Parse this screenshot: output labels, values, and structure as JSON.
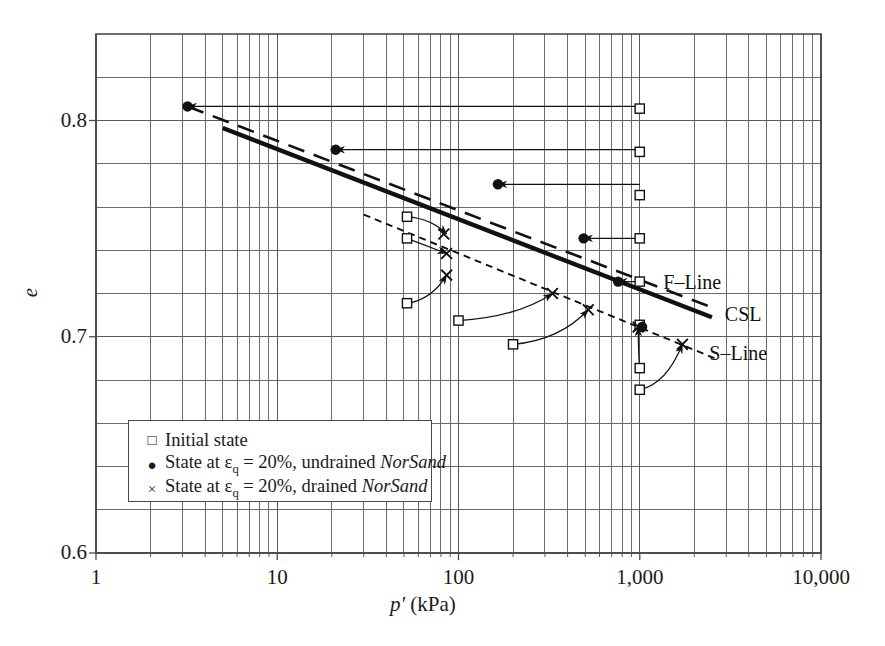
{
  "chart_data": {
    "type": "scatter",
    "title": "",
    "xlabel": "p' (kPa)",
    "ylabel": "e",
    "xscale": "log",
    "xlim": [
      1,
      10000
    ],
    "ylim": [
      0.6,
      0.84
    ],
    "xticks": [
      "1",
      "10",
      "100",
      "1,000",
      "10,000"
    ],
    "xtick_values": [
      1,
      10,
      100,
      1000,
      10000
    ],
    "yticks": [
      "0.6",
      "0.7",
      "0.8"
    ],
    "ytick_values": [
      0.6,
      0.7,
      0.8
    ],
    "grid": "log-minor-vertical, 0.02-minor-horizontal",
    "legend_position": "lower-left-inside",
    "series": [
      {
        "name": "Initial state",
        "marker": "open-square",
        "points": [
          {
            "p": 1000,
            "e": 0.8055
          },
          {
            "p": 1000,
            "e": 0.7855
          },
          {
            "p": 1000,
            "e": 0.7655
          },
          {
            "p": 1000,
            "e": 0.7455
          },
          {
            "p": 1000,
            "e": 0.7255
          },
          {
            "p": 1000,
            "e": 0.7055
          },
          {
            "p": 1000,
            "e": 0.6855
          },
          {
            "p": 1000,
            "e": 0.6755
          },
          {
            "p": 52,
            "e": 0.7555
          },
          {
            "p": 52,
            "e": 0.7455
          },
          {
            "p": 52,
            "e": 0.7155
          },
          {
            "p": 100,
            "e": 0.7075
          },
          {
            "p": 200,
            "e": 0.6965
          }
        ]
      },
      {
        "name": "State at eq = 20%, undrained NorSand",
        "marker": "filled-circle",
        "points": [
          {
            "p": 3.2,
            "e": 0.8065
          },
          {
            "p": 21,
            "e": 0.7865
          },
          {
            "p": 165,
            "e": 0.7705
          },
          {
            "p": 490,
            "e": 0.7455
          },
          {
            "p": 760,
            "e": 0.7255
          },
          {
            "p": 1030,
            "e": 0.7045
          }
        ]
      },
      {
        "name": "State at eq = 20%, drained NorSand",
        "marker": "cross",
        "points": [
          {
            "p": 83,
            "e": 0.7475
          },
          {
            "p": 86,
            "e": 0.7385
          },
          {
            "p": 86,
            "e": 0.7285
          },
          {
            "p": 330,
            "e": 0.72
          },
          {
            "p": 520,
            "e": 0.7125
          },
          {
            "p": 980,
            "e": 0.7045
          },
          {
            "p": 1720,
            "e": 0.6965
          }
        ]
      }
    ],
    "lines": [
      {
        "name": "F-Line",
        "style": "dashed",
        "label": "F–Line",
        "p1": 3.2,
        "e1": 0.8065,
        "p2": 2600,
        "e2": 0.713
      },
      {
        "name": "CSL",
        "style": "solid-thick",
        "label": "CSL",
        "p1": 5.0,
        "e1": 0.7965,
        "p2": 2500,
        "e2": 0.709
      },
      {
        "name": "S-Line",
        "style": "dotted",
        "label": "S–Line",
        "p1": 30,
        "e1": 0.7565,
        "p2": 2600,
        "e2": 0.69
      }
    ],
    "annotations": [
      {
        "type": "arrow",
        "style": "straight-horizontal",
        "from_p": 1000,
        "to_p": 3.2,
        "e": 0.8065
      },
      {
        "type": "arrow",
        "style": "straight-horizontal",
        "from_p": 1000,
        "to_p": 21,
        "e": 0.7865
      },
      {
        "type": "arrow",
        "style": "straight-horizontal",
        "from_p": 1000,
        "to_p": 165,
        "e": 0.7705
      },
      {
        "type": "arrow",
        "style": "straight-horizontal",
        "from_p": 1000,
        "to_p": 490,
        "e": 0.7455
      },
      {
        "type": "arrow",
        "style": "straight-horizontal",
        "from_p": 1000,
        "to_p": 760,
        "e": 0.7255
      },
      {
        "type": "arrow",
        "style": "straight-horizontal",
        "from_p": 1000,
        "to_p": 1030,
        "e": 0.7045
      },
      {
        "type": "arrow",
        "style": "curved",
        "from_p": 52,
        "from_e": 0.7555,
        "to_p": 86,
        "to_e": 0.7475
      },
      {
        "type": "arrow",
        "style": "straight-horizontal",
        "from_p": 52,
        "from_e": 0.7455,
        "to_p": 86,
        "to_e": 0.7385
      },
      {
        "type": "arrow",
        "style": "curved",
        "from_p": 52,
        "from_e": 0.7155,
        "to_p": 86,
        "to_e": 0.7285
      },
      {
        "type": "arrow",
        "style": "curved",
        "from_p": 100,
        "from_e": 0.7075,
        "to_p": 330,
        "to_e": 0.72
      },
      {
        "type": "arrow",
        "style": "curved",
        "from_p": 200,
        "from_e": 0.6965,
        "to_p": 520,
        "to_e": 0.7125
      },
      {
        "type": "arrow",
        "style": "curved",
        "from_p": 1000,
        "from_e": 0.6855,
        "to_p": 980,
        "to_e": 0.7045
      },
      {
        "type": "arrow",
        "style": "curved",
        "from_p": 1000,
        "from_e": 0.6755,
        "to_p": 1720,
        "to_e": 0.6965
      }
    ]
  },
  "axes": {
    "y_label": "e",
    "x_label_symbol": "p′",
    "x_label_unit": "(kPa)",
    "xticks": [
      "1",
      "10",
      "100",
      "1,000",
      "10,000"
    ],
    "yticks": [
      "0.8",
      "0.7",
      "0.6"
    ]
  },
  "line_labels": {
    "f_line": "F–Line",
    "csl": "CSL",
    "s_line": "S–Line"
  },
  "legend": {
    "items": [
      {
        "symbol": "□",
        "text_pre": "Initial state",
        "text_post": "",
        "italic": ""
      },
      {
        "symbol": "●",
        "text_pre": "State at ε",
        "sub": "q",
        "text_mid": " = 20%, undrained ",
        "italic": "NorSand"
      },
      {
        "symbol": "×",
        "text_pre": "State at ε",
        "sub": "q",
        "text_mid": " = 20%, drained ",
        "italic": "NorSand"
      }
    ],
    "row1_full": "Initial state",
    "row2_sym": "●",
    "row3_sym": "×",
    "row1_sym": "□"
  },
  "colors": {
    "axis": "#4a4a4a",
    "grid": "#6b6b6b",
    "data": "#111111",
    "background": "#ffffff"
  }
}
